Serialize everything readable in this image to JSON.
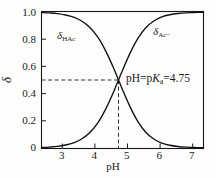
{
  "chart_data": {
    "type": "line",
    "title": "",
    "subtitle": "",
    "xlabel": "pH",
    "ylabel": "δ",
    "xlim": [
      2.35,
      7.4
    ],
    "ylim": [
      0,
      1.0
    ],
    "grid": false,
    "legend_position": "inline-curve-labels",
    "xticks": [
      "3",
      "4",
      "5",
      "6",
      "7"
    ],
    "xtick_values": [
      3,
      4,
      5,
      6,
      7
    ],
    "yticks": [
      "0",
      "0.2",
      "0.4",
      "0.6",
      "0.8",
      "1.0"
    ],
    "ytick_values": [
      0,
      0.2,
      0.4,
      0.6,
      0.8,
      1.0
    ],
    "pka": 4.75,
    "x": [
      2.35,
      2.6,
      2.85,
      3.1,
      3.35,
      3.6,
      3.85,
      4.1,
      4.35,
      4.6,
      4.75,
      4.85,
      5.1,
      5.35,
      5.6,
      5.85,
      6.1,
      6.35,
      6.6,
      6.85,
      7.1,
      7.4
    ],
    "series": [
      {
        "name": "δHAc",
        "label_symbol": "δ",
        "label_subscript": "HAc",
        "values": [
          0.996,
          0.993,
          0.988,
          0.978,
          0.962,
          0.934,
          0.888,
          0.817,
          0.714,
          0.586,
          0.5,
          0.443,
          0.308,
          0.196,
          0.116,
          0.066,
          0.036,
          0.02,
          0.011,
          0.006,
          0.004,
          0.002
        ]
      },
      {
        "name": "δAc−",
        "label_symbol": "δ",
        "label_subscript": "Ac−",
        "values": [
          0.004,
          0.007,
          0.012,
          0.022,
          0.038,
          0.066,
          0.112,
          0.183,
          0.286,
          0.414,
          0.5,
          0.557,
          0.692,
          0.804,
          0.884,
          0.934,
          0.964,
          0.98,
          0.989,
          0.994,
          0.996,
          0.998
        ]
      }
    ],
    "annotations": [
      {
        "name": "pka-crossing",
        "text_prefix": "pH=p",
        "text_italic": "K",
        "text_subscript": "a",
        "text_suffix": "=4.75",
        "at_x": 4.75,
        "at_y": 0.5
      }
    ],
    "guide_lines": [
      {
        "name": "horizontal-half-delta",
        "orientation": "horizontal",
        "value": 0.5,
        "style": "dashed"
      },
      {
        "name": "vertical-pka",
        "orientation": "vertical",
        "value": 4.75,
        "style": "dashed"
      }
    ]
  },
  "labels": {
    "hac_symbol": "δ",
    "hac_subscript": "HAc",
    "ac_symbol": "δ",
    "ac_subscript": "Ac−",
    "xaxis_title": "pH",
    "yaxis_title": "δ",
    "annotation_prefix": "pH=p",
    "annotation_italic": "K",
    "annotation_subscript": "a",
    "annotation_suffix": "=4.75"
  },
  "colors": {
    "axis": "#1a1a1a",
    "curve": "#111111",
    "dashed": "#333333",
    "background": "#fdfdfc",
    "text": "#1a1a1a"
  }
}
